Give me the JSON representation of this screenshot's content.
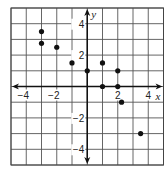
{
  "chart_data": {
    "type": "scatter",
    "title": "",
    "xlabel": "x",
    "ylabel": "y",
    "xlim": [
      -5,
      5
    ],
    "ylim": [
      -5,
      5
    ],
    "grid": true,
    "grid_step": 1,
    "x_ticks": [
      -4,
      -2,
      2,
      4
    ],
    "y_ticks": [
      4,
      2,
      -2,
      -4
    ],
    "x_tick_labels": [
      "−4",
      "−2",
      "2",
      "4"
    ],
    "y_tick_labels": [
      "4",
      "2",
      "−2",
      "−4"
    ],
    "legend": null,
    "points": [
      {
        "x": -3,
        "y": 3.5
      },
      {
        "x": -3,
        "y": 2.75
      },
      {
        "x": -2,
        "y": 2.5
      },
      {
        "x": -1,
        "y": 1.5
      },
      {
        "x": 0,
        "y": 1
      },
      {
        "x": 1,
        "y": 1.5
      },
      {
        "x": 2,
        "y": 1
      },
      {
        "x": 1,
        "y": 0
      },
      {
        "x": 2,
        "y": 0
      },
      {
        "x": 2.25,
        "y": -1
      },
      {
        "x": 3.5,
        "y": -3
      }
    ]
  },
  "colors": {
    "grid": "#555555",
    "axis": "#111111",
    "point": "#111111",
    "background": "#ffffff",
    "border": "#444444"
  }
}
